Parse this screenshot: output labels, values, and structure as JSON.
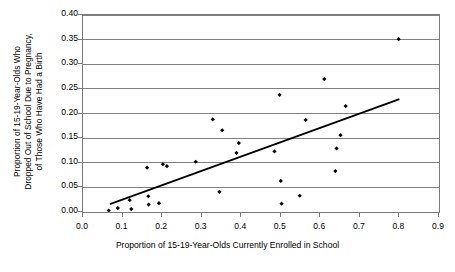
{
  "chart_data": {
    "type": "scatter",
    "title": "",
    "xlabel": "Proportion of 15-19-Year-Olds Currently Enrolled in School",
    "ylabel_lines": [
      "Proportion of 15-19-Year-Olds Who",
      "Dropped Out of School Due to Pregnancy,",
      "of Those Who Have Had a Birth"
    ],
    "ylabel": "Proportion of 15-19-Year-Olds Who Dropped Out of School Due to Pregnancy, of Those Who Have Had a Birth",
    "xlim": [
      0.0,
      0.9
    ],
    "ylim": [
      0.0,
      0.4
    ],
    "xticks": [
      "0.0",
      "0.1",
      "0.2",
      "0.3",
      "0.4",
      "0.5",
      "0.6",
      "0.7",
      "0.8",
      "0.9"
    ],
    "xtick_values": [
      0.0,
      0.1,
      0.2,
      0.3,
      0.4,
      0.5,
      0.6,
      0.7,
      0.8,
      0.9
    ],
    "yticks": [
      "0.00",
      "0.05",
      "0.10",
      "0.15",
      "0.20",
      "0.25",
      "0.30",
      "0.35",
      "0.40"
    ],
    "ytick_values": [
      0.0,
      0.05,
      0.1,
      0.15,
      0.2,
      0.25,
      0.3,
      0.35,
      0.4
    ],
    "grid": "horizontal",
    "legend": "none",
    "marker": "diamond",
    "marker_color": "#000000",
    "gridline_color": "#808080",
    "axis_color": "#7a7a7a",
    "trendline_color": "#000000",
    "series": [
      {
        "name": "Countries",
        "points": [
          [
            0.065,
            0.003
          ],
          [
            0.088,
            0.008
          ],
          [
            0.118,
            0.024
          ],
          [
            0.122,
            0.006
          ],
          [
            0.162,
            0.09
          ],
          [
            0.165,
            0.032
          ],
          [
            0.166,
            0.015
          ],
          [
            0.192,
            0.018
          ],
          [
            0.202,
            0.097
          ],
          [
            0.212,
            0.093
          ],
          [
            0.285,
            0.102
          ],
          [
            0.328,
            0.188
          ],
          [
            0.345,
            0.041
          ],
          [
            0.352,
            0.166
          ],
          [
            0.388,
            0.12
          ],
          [
            0.394,
            0.14
          ],
          [
            0.484,
            0.123
          ],
          [
            0.497,
            0.238
          ],
          [
            0.5,
            0.063
          ],
          [
            0.502,
            0.017
          ],
          [
            0.548,
            0.033
          ],
          [
            0.563,
            0.187
          ],
          [
            0.61,
            0.27
          ],
          [
            0.638,
            0.083
          ],
          [
            0.641,
            0.129
          ],
          [
            0.651,
            0.156
          ],
          [
            0.664,
            0.215
          ],
          [
            0.798,
            0.351
          ]
        ]
      }
    ],
    "trendline": {
      "name": "Linear fit",
      "x0": 0.068,
      "y0": 0.016,
      "x1": 0.8,
      "y1": 0.229
    }
  }
}
